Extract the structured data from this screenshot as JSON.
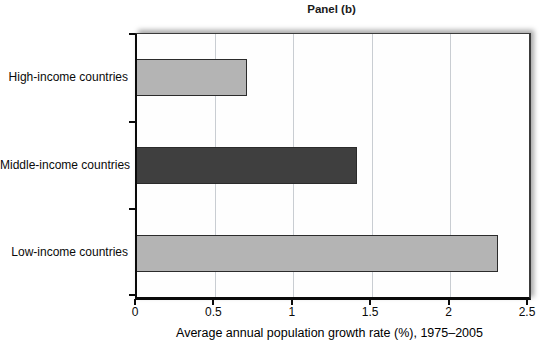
{
  "chart_data": {
    "type": "bar",
    "orientation": "horizontal",
    "title": "Panel (b)",
    "categories": [
      "High-income countries",
      "Middle-income countries",
      "Low-income countries"
    ],
    "values": [
      0.7,
      1.4,
      2.3
    ],
    "bar_colors": [
      "#b4b4b4",
      "#3f3f3f",
      "#b4b4b4"
    ],
    "bar_border_color": "#2b2b2b",
    "xlabel": "Average annual population growth rate (%), 1975–2005",
    "xlim": [
      0,
      2.5
    ],
    "xticks": [
      0,
      0.5,
      1,
      1.5,
      2,
      2.5
    ],
    "xtick_labels": [
      "0",
      "0.5",
      "1",
      "1.5",
      "2",
      "2.5"
    ],
    "grid": "vertical-gridlines-at-xticks",
    "gridline_color": "#c9cdd2",
    "axis_color": "#0a0a0a",
    "legend": "none"
  }
}
